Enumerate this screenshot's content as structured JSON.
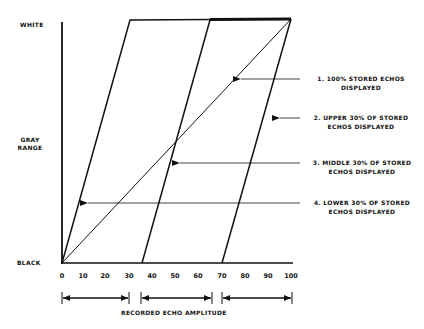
{
  "axis": {
    "y_top_label": "WHITE",
    "y_mid_label_line1": "GRAY",
    "y_mid_label_line2": "RANGE",
    "y_bottom_label": "BLACK",
    "x_label": "RECORDED ECHO AMPLITUDE",
    "x_ticks": [
      "0",
      "10",
      "20",
      "30",
      "40",
      "50",
      "60",
      "70",
      "80",
      "90",
      "100"
    ]
  },
  "legend": [
    {
      "line1": "1. 100% STORED ECHOS",
      "line2": "DISPLAYED"
    },
    {
      "line1": "2. UPPER 30% OF STORED",
      "line2": "ECHOS DISPLAYED"
    },
    {
      "line1": "3. MIDDLE 30% OF STORED",
      "line2": "ECHOS DISPLAYED"
    },
    {
      "line1": "4. LOWER 30% OF STORED",
      "line2": "ECHOS DISPLAYED"
    }
  ],
  "ranges": [
    {
      "from": 0,
      "to": 30
    },
    {
      "from": 35,
      "to": 65
    },
    {
      "from": 70,
      "to": 100
    }
  ],
  "colors": {
    "ink": "#111111",
    "background": "#ffffff"
  }
}
